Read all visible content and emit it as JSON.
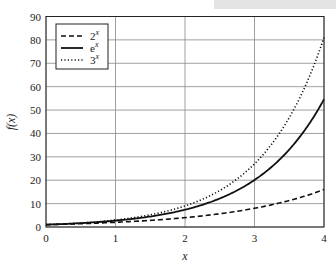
{
  "chart_data": {
    "type": "line",
    "title": "",
    "xlabel": "x",
    "ylabel": "f(x)",
    "xlim": [
      0,
      4
    ],
    "ylim": [
      0,
      90
    ],
    "xticks": [
      "0",
      "1",
      "2",
      "3",
      "4"
    ],
    "yticks": [
      "0",
      "10",
      "20",
      "30",
      "40",
      "50",
      "60",
      "70",
      "80",
      "90"
    ],
    "grid": true,
    "legend_position": "upper left",
    "x": [
      0,
      0.5,
      1,
      1.5,
      2,
      2.5,
      3,
      3.5,
      4
    ],
    "series": [
      {
        "name": "2^x",
        "style": "dashed",
        "values": [
          1,
          1.41,
          2,
          2.83,
          4,
          5.66,
          8,
          11.31,
          16
        ]
      },
      {
        "name": "e^x",
        "style": "solid",
        "values": [
          1,
          1.65,
          2.72,
          4.48,
          7.39,
          12.18,
          20.09,
          33.12,
          54.6
        ]
      },
      {
        "name": "3^x",
        "style": "dotted",
        "values": [
          1,
          1.73,
          3,
          5.2,
          9,
          15.59,
          27,
          46.77,
          81
        ]
      }
    ]
  },
  "legend": {
    "items": [
      {
        "base": "2",
        "exp": "x"
      },
      {
        "base": "e",
        "exp": "x"
      },
      {
        "base": "3",
        "exp": "x"
      }
    ]
  },
  "axes": {
    "xlabel": "x",
    "ylabel": "f(x)"
  }
}
